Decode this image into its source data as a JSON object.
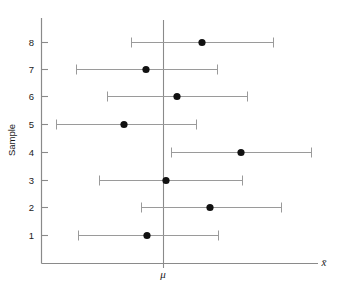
{
  "chart_data": {
    "type": "scatter",
    "title": "",
    "subtitle": "",
    "xlabel": "x̄",
    "ylabel": "Sample",
    "grid": false,
    "legend": null,
    "annotations": [
      {
        "name": "mu-reference-line",
        "label": "μ",
        "orientation": "vertical",
        "x": 0
      }
    ],
    "y_categories": [
      "1",
      "2",
      "3",
      "4",
      "5",
      "6",
      "7",
      "8"
    ],
    "ytick_labels": [
      "8",
      "7",
      "6",
      "5",
      "4",
      "3",
      "2",
      "1"
    ],
    "ylim": [
      0.4,
      8.6
    ],
    "xlim": [
      -1.35,
      1.75
    ],
    "xtick_labels": [],
    "mu_value": 0,
    "series": [
      {
        "name": "Sample mean with confidence interval",
        "points": [
          {
            "sample": 8,
            "mean": 0.44,
            "lower": -0.36,
            "upper": 1.23,
            "contains_mu": true
          },
          {
            "sample": 7,
            "mean": -0.2,
            "lower": -0.98,
            "upper": 0.61,
            "contains_mu": true
          },
          {
            "sample": 6,
            "mean": 0.16,
            "lower": -0.64,
            "upper": 0.95,
            "contains_mu": true
          },
          {
            "sample": 5,
            "mean": -0.45,
            "lower": -1.22,
            "upper": 0.38,
            "contains_mu": true
          },
          {
            "sample": 4,
            "mean": 0.89,
            "lower": 0.09,
            "upper": 1.68,
            "contains_mu": false
          },
          {
            "sample": 3,
            "mean": 0.04,
            "lower": -0.73,
            "upper": 0.91,
            "contains_mu": true
          },
          {
            "sample": 2,
            "mean": 0.28,
            "lower": -0.26,
            "upper": 1.38,
            "contains_mu": true
          },
          {
            "sample": 1,
            "mean": -0.1,
            "lower": -0.96,
            "upper": 0.35,
            "contains_mu": true
          }
        ]
      }
    ],
    "pixel_geometry": {
      "note": "pixel positions measured from the source rendering",
      "mu_x": 163,
      "axis_x": 41,
      "axis_y": 263,
      "rows": [
        {
          "sample": 8,
          "y": 42,
          "lower_x": 131,
          "upper_x": 273,
          "dot_x": 202
        },
        {
          "sample": 7,
          "y": 69,
          "lower_x": 76,
          "upper_x": 217,
          "dot_x": 146
        },
        {
          "sample": 6,
          "y": 96,
          "lower_x": 107,
          "upper_x": 247,
          "dot_x": 177
        },
        {
          "sample": 5,
          "y": 124,
          "lower_x": 56,
          "upper_x": 196,
          "dot_x": 124
        },
        {
          "sample": 4,
          "y": 152,
          "lower_x": 171,
          "upper_x": 311,
          "dot_x": 241
        },
        {
          "sample": 3,
          "y": 180,
          "lower_x": 99,
          "upper_x": 242,
          "dot_x": 166
        },
        {
          "sample": 2,
          "y": 207,
          "lower_x": 141,
          "upper_x": 281,
          "dot_x": 210
        },
        {
          "sample": 1,
          "y": 235,
          "lower_x": 78,
          "upper_x": 218,
          "dot_x": 147
        }
      ]
    },
    "colors": {
      "dot": "#111111",
      "interval": "#9a9a9a",
      "axis": "#8a8a8a",
      "text": "#1a1a1a",
      "background": "#ffffff"
    }
  }
}
